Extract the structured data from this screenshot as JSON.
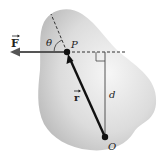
{
  "diagram": {
    "labels": {
      "force": "F",
      "position_vector": "r",
      "angle": "θ",
      "point_application": "P",
      "origin": "O",
      "moment_arm": "d"
    },
    "colors": {
      "body_light": "#f4f4f4",
      "body_dark": "#bdbdbd",
      "line": "#111111",
      "force_arrow": "#444444",
      "dashed": "#333333"
    },
    "points": {
      "P": [
        67,
        52
      ],
      "O": [
        105,
        137
      ],
      "foot_of_perpendicular": [
        105,
        52
      ]
    }
  }
}
